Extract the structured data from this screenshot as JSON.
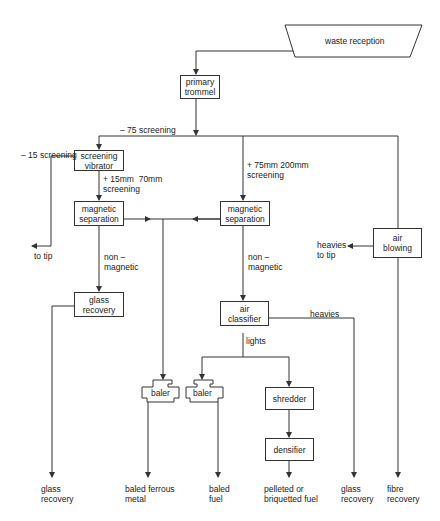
{
  "nodes": {
    "waste_reception": "waste reception",
    "primary_trommel": "primary\ntrommel",
    "screening_vibrator": "screening\nvibrator",
    "magnetic_sep_left": "magnetic\nseparation",
    "magnetic_sep_right": "magnetic\nseparation",
    "air_blowing": "air\nblowing",
    "glass_recovery_box": "glass\nrecovery",
    "air_classifier": "air\nclassifier",
    "baler_left": "baler",
    "baler_right": "baler",
    "shredder": "shredder",
    "densifier": "densifier"
  },
  "labels": {
    "screening_75": "– 75 screening",
    "screening_15": "– 15 screening",
    "screening_15_70": "+ 15mm  70mm\nscreening",
    "screening_75_200": "+ 75mm 200mm\nscreening",
    "to_tip": "to tip",
    "heavies_to_tip": "heavies\nto tip",
    "non_magnetic_left": "non –\nmagnetic",
    "non_magnetic_right": "non –\nmagnetic",
    "heavies": "heavies",
    "lights": "lights"
  },
  "outputs": {
    "glass_recovery_1": "glass\nrecovery",
    "baled_ferrous_metal": "baled ferrous\nmetal",
    "baled_fuel": "baled\nfuel",
    "pelleted_fuel": "pelleted or\nbriquetted fuel",
    "glass_recovery_2": "glass\nrecovery",
    "fibre_recovery": "fibre\nrecovery"
  },
  "colors": {
    "line": "#333333",
    "text": "#222222",
    "background": "#ffffff"
  }
}
